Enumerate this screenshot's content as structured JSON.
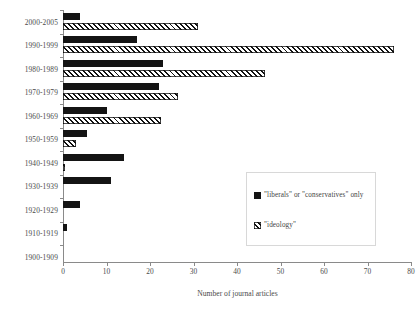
{
  "chart_data": {
    "type": "bar",
    "orientation": "horizontal",
    "title": "",
    "xlabel": "Number of journal articles",
    "ylabel": "",
    "xlim": [
      0,
      80
    ],
    "xticks": [
      0,
      10,
      20,
      30,
      40,
      50,
      60,
      70,
      80
    ],
    "grid": false,
    "legend_position": "lower-right",
    "categories": [
      "2000-2005",
      "1990-1999",
      "1980-1989",
      "1970-1979",
      "1960-1969",
      "1950-1959",
      "1940-1949",
      "1930-1939",
      "1920-1929",
      "1910-1919",
      "1900-1909"
    ],
    "series": [
      {
        "name": "\"liberals\" or \"conservatives\" only",
        "style": "solid",
        "color": "#141414",
        "values": [
          4,
          17,
          23,
          22,
          10,
          5.5,
          14,
          11,
          4,
          1,
          0
        ]
      },
      {
        "name": "\"ideology\"",
        "style": "hatched",
        "color": "#111111",
        "values": [
          31,
          76,
          46.5,
          26.5,
          22.5,
          3,
          0.5,
          0,
          0,
          0,
          0
        ]
      }
    ]
  },
  "axis": {
    "x_title": "Number of journal articles",
    "tick_labels": [
      "0",
      "10",
      "20",
      "30",
      "40",
      "50",
      "60",
      "70",
      "80"
    ]
  },
  "legend": {
    "entries": [
      {
        "label": "\"liberals\" or \"conservatives\" only",
        "swatch": "solid-square-swatch"
      },
      {
        "label": "\"ideology\"",
        "swatch": "hatched-square-swatch"
      }
    ]
  }
}
